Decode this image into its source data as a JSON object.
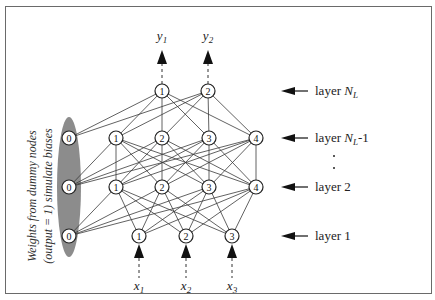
{
  "diagram": {
    "type": "feed-forward neural network",
    "outputs": [
      {
        "base": "y",
        "sub": "1",
        "x": 162
      },
      {
        "base": "y",
        "sub": "2",
        "x": 208
      }
    ],
    "inputs": [
      {
        "base": "x",
        "sub": "1",
        "x": 139
      },
      {
        "base": "x",
        "sub": "2",
        "x": 186
      },
      {
        "base": "x",
        "sub": "3",
        "x": 232
      }
    ],
    "layers": [
      {
        "id": "NL",
        "label_prefix": "layer ",
        "label_italic": "N",
        "label_sub": "L",
        "label_suffix": "",
        "y": 91,
        "nodes": [
          {
            "label": "1",
            "x": 162
          },
          {
            "label": "2",
            "x": 208
          }
        ]
      },
      {
        "id": "NL-1",
        "label_prefix": "layer ",
        "label_italic": "N",
        "label_sub": "L",
        "label_suffix": "-1",
        "y": 138,
        "nodes": [
          {
            "label": "0",
            "x": 69,
            "bias": true
          },
          {
            "label": "1",
            "x": 116
          },
          {
            "label": "2",
            "x": 162
          },
          {
            "label": "3",
            "x": 209
          },
          {
            "label": "4",
            "x": 256
          }
        ]
      },
      {
        "id": "2",
        "label_prefix": "layer 2",
        "label_italic": "",
        "label_sub": "",
        "label_suffix": "",
        "y": 187,
        "nodes": [
          {
            "label": "0",
            "x": 69,
            "bias": true
          },
          {
            "label": "1",
            "x": 116
          },
          {
            "label": "2",
            "x": 162
          },
          {
            "label": "3",
            "x": 209
          },
          {
            "label": "4",
            "x": 256
          }
        ]
      },
      {
        "id": "1",
        "label_prefix": "layer 1",
        "label_italic": "",
        "label_sub": "",
        "label_suffix": "",
        "y": 236,
        "nodes": [
          {
            "label": "0",
            "x": 69,
            "bias": true
          },
          {
            "label": "1",
            "x": 139
          },
          {
            "label": "2",
            "x": 186
          },
          {
            "label": "3",
            "x": 232
          }
        ]
      }
    ],
    "ellipsis": ".",
    "side_note": {
      "line1": "Weights from dummy nodes",
      "line2": "(output = 1) simulate biases"
    },
    "colors": {
      "bias_ellipse": "#8c8c8c",
      "frame": "#6a6a6a",
      "edge": "#3a3a3a"
    }
  }
}
